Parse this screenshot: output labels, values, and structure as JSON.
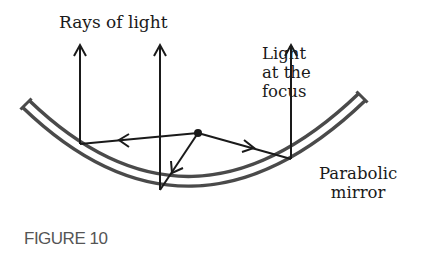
{
  "figure": {
    "caption": "FIGURE 10",
    "labels": {
      "rays": "Rays of light",
      "focus": [
        "Light",
        "at the",
        "focus"
      ],
      "mirror": [
        "Parabolic",
        "mirror"
      ]
    },
    "colors": {
      "ink": "#1a1a1a",
      "mirror": "#4a4a4a",
      "caption": "#555555",
      "background": "#ffffff"
    },
    "geometry": {
      "focus_point": [
        198,
        133
      ],
      "rays": [
        {
          "name": "left-ray",
          "reflection_point": [
            80,
            144
          ],
          "exit_top": [
            80,
            45
          ]
        },
        {
          "name": "middle-ray",
          "reflection_point": [
            160,
            190
          ],
          "exit_top": [
            160,
            45
          ]
        },
        {
          "name": "right-ray",
          "reflection_point": [
            291,
            159
          ],
          "exit_top": [
            291,
            45
          ]
        }
      ]
    }
  }
}
